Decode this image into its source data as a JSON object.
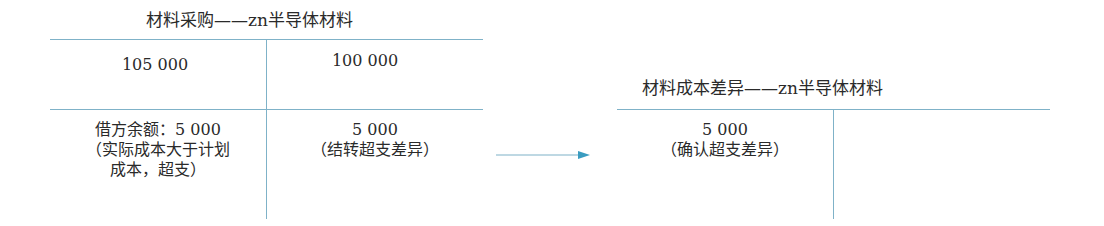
{
  "diagram": {
    "type": "T-account flow",
    "colors": {
      "line": "#7fb2c8",
      "arrow": "#3a9cc0",
      "text": "#2a2a2a"
    },
    "left_account": {
      "title": "材料采购——zn半导体材料",
      "debit_entries": [
        {
          "amount": "105 000"
        },
        {
          "label_lines": [
            "借方余额：5 000",
            "（实际成本大于计划",
            "成本，超支）"
          ]
        }
      ],
      "credit_entries": [
        {
          "amount": "100 000"
        },
        {
          "label_lines": [
            "5 000",
            "（结转超支差异）"
          ]
        }
      ]
    },
    "right_account": {
      "title": "材料成本差异——zn半导体材料",
      "debit_entries": [
        {
          "label_lines": [
            "5 000",
            "（确认超支差异）"
          ]
        }
      ],
      "credit_entries": []
    },
    "arrow": {
      "from": "left_account.credit_transfer",
      "to": "right_account.debit",
      "icon": "right-arrow-icon"
    }
  }
}
